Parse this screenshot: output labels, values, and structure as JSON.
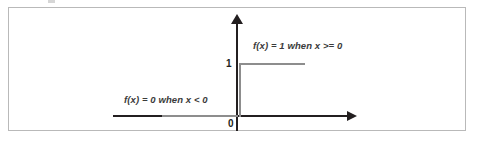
{
  "figure": {
    "border_color": "#b9b9b9",
    "background_color": "#ffffff",
    "axis_color": "#231f20",
    "curve_color": "#8d8d8d",
    "label_color": "#231f20",
    "annotation_color": "#3b3b3b"
  },
  "axes": {
    "y_tick_label": "1",
    "origin_label": "0"
  },
  "annotations": {
    "upper": "f(x) = 1 when x >= 0",
    "lower": "f(x) = 0 when x < 0"
  },
  "chart_data": {
    "type": "line",
    "title": "",
    "subtitle": "",
    "xlabel": "",
    "ylabel": "",
    "xlim": [
      -1.05,
      1.05
    ],
    "ylim": [
      -0.12,
      1.35
    ],
    "grid": false,
    "legend_position": "none",
    "series": [
      {
        "name": "Heaviside step function",
        "x": [
          -1.0,
          -0.52,
          0.0,
          0.0,
          0.58
        ],
        "values": [
          0,
          0,
          0,
          1,
          1
        ]
      }
    ],
    "annotations": [
      {
        "text": "f(x) = 1 when x >= 0",
        "x": 0.08,
        "y": 1.2
      },
      {
        "text": "f(x) = 0 when x < 0",
        "x": -0.88,
        "y": 0.32
      }
    ],
    "tick_labels": {
      "y": [
        "0",
        "1"
      ],
      "x": [
        "0"
      ]
    }
  }
}
